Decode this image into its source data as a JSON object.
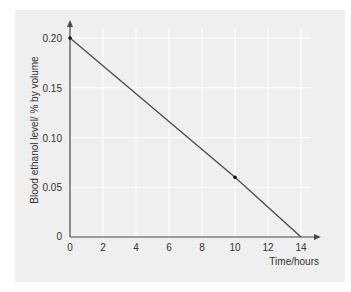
{
  "chart_data": {
    "type": "line",
    "title": "",
    "xlabel": "Time/hours",
    "ylabel": "Blood ethanol level/ % by volume",
    "x": [
      0,
      10,
      14
    ],
    "series": [
      {
        "name": "Blood ethanol level",
        "values": [
          0.2,
          0.06,
          0.0
        ]
      }
    ],
    "marked_points": [
      {
        "x": 0,
        "y": 0.2
      },
      {
        "x": 10,
        "y": 0.06
      }
    ],
    "x_ticks": [
      "0",
      "2",
      "4",
      "6",
      "8",
      "10",
      "12",
      "14"
    ],
    "y_ticks": [
      "0",
      "0.05",
      "0.10",
      "0.15",
      "0.20"
    ],
    "xlim": [
      0,
      14
    ],
    "ylim": [
      0,
      0.2
    ],
    "grid": true,
    "legend": "none",
    "colors": {
      "line": "#4a4a4a",
      "background": "#efefef",
      "grid": "#ffffff",
      "axis": "#4a4a4a"
    }
  }
}
